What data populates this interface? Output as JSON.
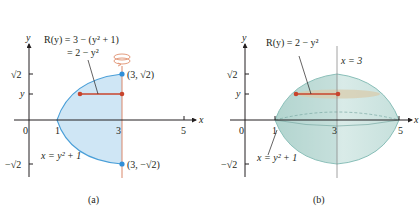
{
  "panel_a": {
    "caption": "(a)",
    "axis_x_label": "x",
    "axis_y_label": "y",
    "x_ticks": [
      "0",
      "1",
      "3",
      "5"
    ],
    "y_ticks": [
      "√2",
      "y",
      "−√2"
    ],
    "radius_label_line1": "R(y) = 3 − (y² + 1)",
    "radius_label_line2": "= 2 − y²",
    "curve_label": "x = y² + 1",
    "point_top": "(3, √2)",
    "point_bottom": "(3, −√2)",
    "rotation_icon": "rotation-arrow-icon"
  },
  "panel_b": {
    "caption": "(b)",
    "axis_x_label": "x",
    "axis_y_label": "y",
    "x_ticks": [
      "0",
      "1",
      "3",
      "5"
    ],
    "y_ticks": [
      "√2",
      "y",
      "−√2"
    ],
    "radius_label": "R(y) = 2 − y²",
    "axis_of_rotation_label": "x = 3",
    "curve_label": "x = y² + 1"
  },
  "colors": {
    "region_fill": "#cfe6f5",
    "curve": "#4a9fd8",
    "solid_fill": "#cfe3e0",
    "solid_edge": "#6fb0a8",
    "radius_segment": "#c8442c",
    "point": "#2f8fd9",
    "axis": "#231f20",
    "rotation_line": "#e0906e"
  }
}
